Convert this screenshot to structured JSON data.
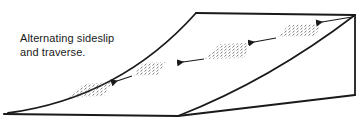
{
  "caption": {
    "line1": "Alternating sideslip",
    "line2": "and traverse."
  },
  "figure": {
    "stroke_color": "#1a1a1a",
    "hatch_color": "#555555",
    "background": "#ffffff",
    "patches": 4,
    "arrows": 4,
    "arrow_direction": "right-to-left, descending"
  }
}
